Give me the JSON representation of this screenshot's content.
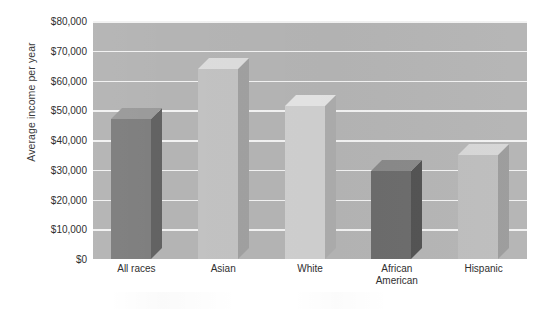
{
  "chart_data": {
    "type": "bar",
    "title": "",
    "subtitle": "",
    "xlabel": "",
    "ylabel": "Average income per year",
    "categories": [
      "All races",
      "Asian",
      "White",
      "African\nAmerican",
      "Hispanic"
    ],
    "values": [
      47000,
      64000,
      51500,
      29500,
      35000
    ],
    "series": [
      {
        "name": "Average income per year",
        "values": [
          47000,
          64000,
          51500,
          29500,
          35000
        ]
      }
    ],
    "ylim": [
      0,
      80000
    ],
    "ytick_values": [
      0,
      10000,
      20000,
      30000,
      40000,
      50000,
      60000,
      70000,
      80000
    ],
    "ytick_labels": [
      "$0",
      "$10,000",
      "$20,000",
      "$30,000",
      "$40,000",
      "$50,000",
      "$60,000",
      "$70,000",
      "$80,000"
    ],
    "grid": true,
    "gridline_color": "#f2f2f2",
    "legend": "none",
    "legend_position": "none",
    "annotations": [],
    "style": "3d-column",
    "plot_background": "#b4b4b4",
    "bar_colors": [
      "#7e7e7e",
      "#c2c2c2",
      "#cfcfcf",
      "#6b6b6b",
      "#bdbdbd"
    ],
    "bar_side_colors": [
      "#626262",
      "#a0a0a0",
      "#acacac",
      "#525252",
      "#9b9b9b"
    ],
    "bar_top_colors": [
      "#9a9a9a",
      "#dcdcdc",
      "#e4e4e4",
      "#888888",
      "#d6d6d6"
    ]
  },
  "axis": {
    "y_title": "Average income per year"
  }
}
